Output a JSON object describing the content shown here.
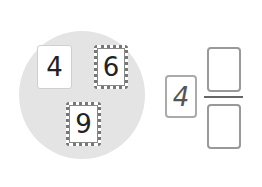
{
  "circle_cards": [
    {
      "value": "4",
      "style": "plain"
    },
    {
      "value": "6",
      "style": "dotted"
    },
    {
      "value": "9",
      "style": "dotted"
    }
  ],
  "fraction": {
    "whole": "4",
    "numerator": "",
    "denominator": ""
  }
}
